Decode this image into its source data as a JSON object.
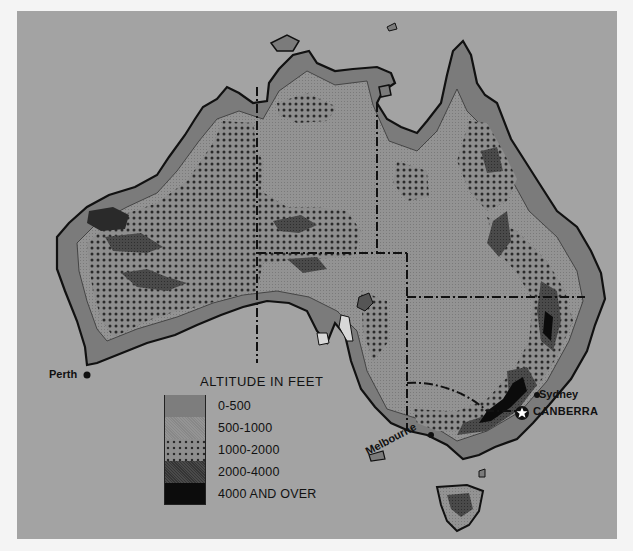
{
  "map": {
    "title": "Australia altitude map",
    "background_color": "#a3a3a3",
    "cities": [
      {
        "name": "Perth",
        "type": "city"
      },
      {
        "name": "Sydney",
        "type": "city"
      },
      {
        "name": "CANBERRA",
        "type": "capital"
      },
      {
        "name": "Melbourne",
        "type": "city"
      }
    ],
    "legend": {
      "title": "ALTITUDE IN FEET",
      "items": [
        {
          "label": "0-500",
          "color": "#7d7d7d",
          "pattern": "solid"
        },
        {
          "label": "500-1000",
          "color": "#909090",
          "pattern": "fine-screen"
        },
        {
          "label": "1000-2000",
          "color": "#8a8a8a",
          "pattern": "dots"
        },
        {
          "label": "2000-4000",
          "color": "#454545",
          "pattern": "dark-screen"
        },
        {
          "label": "4000 AND OVER",
          "color": "#0c0c0c",
          "pattern": "solid"
        }
      ]
    }
  }
}
